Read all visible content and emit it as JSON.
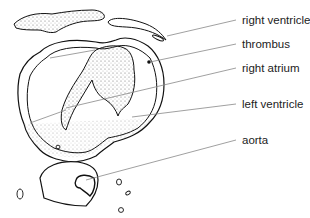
{
  "figure": {
    "labels": [
      {
        "id": "right-ventricle",
        "text": "right ventricle",
        "y": 14
      },
      {
        "id": "thrombus",
        "text": "thrombus",
        "y": 38
      },
      {
        "id": "right-atrium",
        "text": "right atrium",
        "y": 62
      },
      {
        "id": "left-ventricle",
        "text": "left ventricle",
        "y": 98
      },
      {
        "id": "aorta",
        "text": "aorta",
        "y": 134
      }
    ],
    "colors": {
      "outline": "#111111",
      "leader": "#888888",
      "stipple": "#555555"
    }
  }
}
